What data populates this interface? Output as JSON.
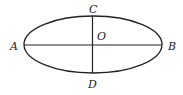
{
  "diagram": {
    "type": "ellipse-with-axes",
    "colors": {
      "stroke": "#222222",
      "background": "#ffffff"
    },
    "ellipse": {
      "cx": 93,
      "cy": 44.5,
      "rx": 69,
      "ry": 28.5
    },
    "major_axis": {
      "from": "A",
      "to": "B"
    },
    "minor_axis": {
      "from": "C",
      "to": "D"
    },
    "center": "O",
    "labels": {
      "A": "A",
      "B": "B",
      "C": "C",
      "D": "D",
      "O": "O"
    }
  }
}
